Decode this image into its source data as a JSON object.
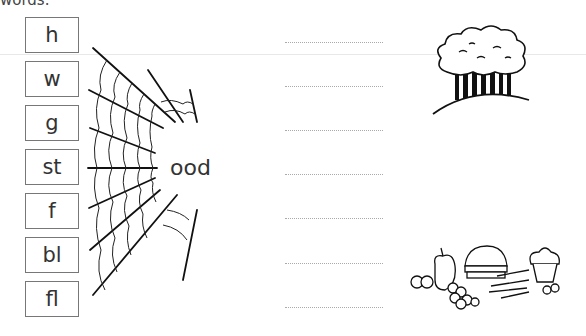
{
  "header": {
    "cutoff_text": "words."
  },
  "onsets": [
    {
      "label": "h"
    },
    {
      "label": "w"
    },
    {
      "label": "g"
    },
    {
      "label": "st"
    },
    {
      "label": "f"
    },
    {
      "label": "bl"
    },
    {
      "label": "fl"
    }
  ],
  "rime": "ood",
  "answer_lines": 7,
  "pictures": [
    {
      "name": "wood-trees-icon",
      "description": "trees on a hill"
    },
    {
      "name": "food-icon",
      "description": "pile of food: burger, fries, cupcake, apple, grapes"
    }
  ]
}
